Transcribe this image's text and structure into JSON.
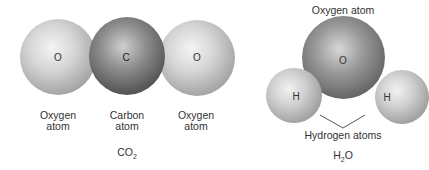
{
  "co2": {
    "atoms": [
      {
        "symbol": "O",
        "caption_line1": "Oxygen",
        "caption_line2": "atom"
      },
      {
        "symbol": "C",
        "caption_line1": "Carbon",
        "caption_line2": "atom"
      },
      {
        "symbol": "O",
        "caption_line1": "Oxygen",
        "caption_line2": "atom"
      }
    ],
    "formula_main": "CO",
    "formula_sub": "2"
  },
  "h2o": {
    "oxygen_caption": "Oxygen atom",
    "oxygen_symbol": "O",
    "hydrogen_left_symbol": "H",
    "hydrogen_right_symbol": "H",
    "hydrogen_caption": "Hydrogen atoms",
    "formula_pre": "H",
    "formula_sub": "2",
    "formula_post": "O"
  }
}
